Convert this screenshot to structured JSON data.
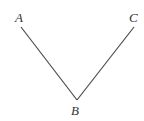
{
  "diagram": {
    "type": "angle",
    "points": {
      "A": {
        "label": "A",
        "x": 21,
        "y": 27
      },
      "B": {
        "label": "B",
        "x": 77,
        "y": 100
      },
      "C": {
        "label": "C",
        "x": 134,
        "y": 27
      }
    },
    "segments": [
      [
        "A",
        "B"
      ],
      [
        "B",
        "C"
      ]
    ],
    "colors": {
      "line": "#4a4a4a",
      "text": "#333333",
      "background": "#ffffff"
    }
  }
}
